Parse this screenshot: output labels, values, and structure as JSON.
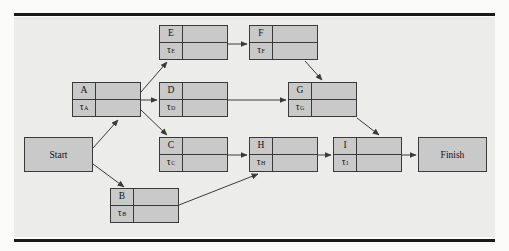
{
  "figure": {
    "kind": "project-network-diagram",
    "background_color": "#ececeb",
    "node_fill": "#c9c9c9",
    "node_border": "#3a3a3a",
    "rule_color": "#1b1b1b",
    "duration_symbol": "τ"
  },
  "rules": [
    {
      "name": "top-rule",
      "x": 14,
      "y": 13,
      "width": 481,
      "height": 3
    },
    {
      "name": "bottom-rule",
      "x": 14,
      "y": 239,
      "width": 481,
      "height": 3
    }
  ],
  "terminals": [
    {
      "id": "start",
      "label": "Start",
      "x": 24,
      "y": 137,
      "w": 69,
      "h": 35
    },
    {
      "id": "finish",
      "label": "Finish",
      "x": 418,
      "y": 137,
      "w": 69,
      "h": 35
    }
  ],
  "tasks": [
    {
      "id": "A",
      "label": "A",
      "duration_sub": "A",
      "x": 72,
      "y": 82,
      "w": 69,
      "h": 35
    },
    {
      "id": "B",
      "label": "B",
      "duration_sub": "B",
      "x": 110,
      "y": 188,
      "w": 69,
      "h": 35
    },
    {
      "id": "C",
      "label": "C",
      "duration_sub": "C",
      "x": 159,
      "y": 137,
      "w": 69,
      "h": 35
    },
    {
      "id": "D",
      "label": "D",
      "duration_sub": "D",
      "x": 159,
      "y": 82,
      "w": 69,
      "h": 35
    },
    {
      "id": "E",
      "label": "E",
      "duration_sub": "E",
      "x": 159,
      "y": 25,
      "w": 69,
      "h": 35
    },
    {
      "id": "F",
      "label": "F",
      "duration_sub": "F",
      "x": 249,
      "y": 25,
      "w": 69,
      "h": 35
    },
    {
      "id": "G",
      "label": "G",
      "duration_sub": "G",
      "x": 288,
      "y": 82,
      "w": 69,
      "h": 35
    },
    {
      "id": "H",
      "label": "H",
      "duration_sub": "H",
      "x": 249,
      "y": 137,
      "w": 69,
      "h": 35
    },
    {
      "id": "I",
      "label": "I",
      "duration_sub": "I",
      "x": 333,
      "y": 137,
      "w": 69,
      "h": 35
    }
  ],
  "edges": [
    {
      "from": "start",
      "to": "A",
      "x1": 93,
      "y1": 148,
      "x2": 118,
      "y2": 120
    },
    {
      "from": "start",
      "to": "B",
      "x1": 93,
      "y1": 164,
      "x2": 124,
      "y2": 187
    },
    {
      "from": "A",
      "to": "E",
      "x1": 141,
      "y1": 92,
      "x2": 167,
      "y2": 62
    },
    {
      "from": "A",
      "to": "D",
      "x1": 141,
      "y1": 100,
      "x2": 157,
      "y2": 100
    },
    {
      "from": "A",
      "to": "C",
      "x1": 141,
      "y1": 110,
      "x2": 167,
      "y2": 135
    },
    {
      "from": "E",
      "to": "F",
      "x1": 228,
      "y1": 44,
      "x2": 247,
      "y2": 44
    },
    {
      "from": "F",
      "to": "G",
      "x1": 305,
      "y1": 61,
      "x2": 322,
      "y2": 80
    },
    {
      "from": "D",
      "to": "G",
      "x1": 228,
      "y1": 100,
      "x2": 286,
      "y2": 100
    },
    {
      "from": "C",
      "to": "H",
      "x1": 228,
      "y1": 155,
      "x2": 247,
      "y2": 155
    },
    {
      "from": "B",
      "to": "H",
      "x1": 179,
      "y1": 205,
      "x2": 258,
      "y2": 174
    },
    {
      "from": "G",
      "to": "I",
      "x1": 357,
      "y1": 118,
      "x2": 379,
      "y2": 135
    },
    {
      "from": "H",
      "to": "I",
      "x1": 318,
      "y1": 155,
      "x2": 331,
      "y2": 155
    },
    {
      "from": "I",
      "to": "finish",
      "x1": 402,
      "y1": 155,
      "x2": 416,
      "y2": 155
    }
  ]
}
